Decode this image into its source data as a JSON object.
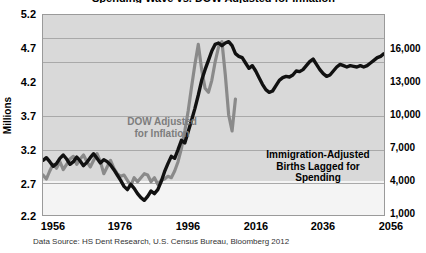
{
  "title": "Spending Wave vs. DOW Adjusted for Inflation",
  "axes": {
    "left_title": "Millions",
    "left_ticks": [
      "5.2",
      "4.7",
      "4.2",
      "3.7",
      "3.2",
      "2.7",
      "2.2"
    ],
    "right_ticks": [
      "16,000",
      "13,000",
      "10,000",
      "7,000",
      "4,000",
      "1,000"
    ],
    "x_ticks": [
      "1956",
      "1976",
      "1996",
      "2016",
      "2036",
      "2056"
    ]
  },
  "annotations": {
    "dow": "DOW Adjusted\nfor Inflation",
    "births": "Immigration-Adjusted\nBirths Lagged for\nSpending"
  },
  "source": "Data Source: HS Dent Research, U.S. Census Bureau, Bloomberg 2012",
  "colors": {
    "births_line": "#111111",
    "dow_line": "#8a8a8a",
    "plot_background": "#d9d9d9",
    "plot_background_lower": "#f4f4f4",
    "gridline": "#a9a9a9",
    "frame": "#9a9a9a"
  },
  "chart_data": {
    "type": "line",
    "title": "Spending Wave vs. DOW Adjusted for Inflation",
    "xlabel": "",
    "ylabel": "Millions",
    "xlim": [
      1956,
      2057
    ],
    "ylim": [
      2.2,
      5.2
    ],
    "y2lim": [
      1000,
      16000
    ],
    "y2label": "",
    "grid": true,
    "legend": "annotations-in-plot",
    "series": [
      {
        "name": "Immigration-Adjusted Births Lagged for Spending",
        "color": "#111111",
        "axis": "left",
        "points": [
          [
            1956,
            3.02
          ],
          [
            1957,
            3.06
          ],
          [
            1958,
            3.0
          ],
          [
            1959,
            2.93
          ],
          [
            1960,
            2.97
          ],
          [
            1961,
            3.05
          ],
          [
            1962,
            3.1
          ],
          [
            1963,
            3.04
          ],
          [
            1964,
            2.96
          ],
          [
            1965,
            3.0
          ],
          [
            1966,
            3.07
          ],
          [
            1967,
            3.01
          ],
          [
            1968,
            2.94
          ],
          [
            1969,
            2.99
          ],
          [
            1970,
            3.06
          ],
          [
            1971,
            3.12
          ],
          [
            1972,
            3.05
          ],
          [
            1973,
            2.98
          ],
          [
            1974,
            3.03
          ],
          [
            1975,
            3.0
          ],
          [
            1976,
            2.95
          ],
          [
            1977,
            2.88
          ],
          [
            1978,
            2.8
          ],
          [
            1979,
            2.72
          ],
          [
            1980,
            2.63
          ],
          [
            1981,
            2.58
          ],
          [
            1982,
            2.66
          ],
          [
            1983,
            2.6
          ],
          [
            1984,
            2.52
          ],
          [
            1985,
            2.46
          ],
          [
            1986,
            2.42
          ],
          [
            1987,
            2.48
          ],
          [
            1988,
            2.56
          ],
          [
            1989,
            2.52
          ],
          [
            1990,
            2.58
          ],
          [
            1991,
            2.7
          ],
          [
            1992,
            2.85
          ],
          [
            1993,
            2.97
          ],
          [
            1994,
            3.08
          ],
          [
            1995,
            3.05
          ],
          [
            1996,
            3.18
          ],
          [
            1997,
            3.32
          ],
          [
            1998,
            3.28
          ],
          [
            1999,
            3.45
          ],
          [
            2000,
            3.62
          ],
          [
            2001,
            3.8
          ],
          [
            2002,
            4.0
          ],
          [
            2003,
            4.22
          ],
          [
            2004,
            4.38
          ],
          [
            2005,
            4.52
          ],
          [
            2006,
            4.66
          ],
          [
            2007,
            4.76
          ],
          [
            2008,
            4.78
          ],
          [
            2009,
            4.74
          ],
          [
            2010,
            4.78
          ],
          [
            2011,
            4.8
          ],
          [
            2012,
            4.74
          ],
          [
            2013,
            4.62
          ],
          [
            2014,
            4.58
          ],
          [
            2015,
            4.56
          ],
          [
            2016,
            4.48
          ],
          [
            2017,
            4.4
          ],
          [
            2018,
            4.44
          ],
          [
            2019,
            4.36
          ],
          [
            2020,
            4.26
          ],
          [
            2021,
            4.16
          ],
          [
            2022,
            4.08
          ],
          [
            2023,
            4.04
          ],
          [
            2024,
            4.06
          ],
          [
            2025,
            4.14
          ],
          [
            2026,
            4.22
          ],
          [
            2027,
            4.26
          ],
          [
            2028,
            4.28
          ],
          [
            2029,
            4.27
          ],
          [
            2030,
            4.3
          ],
          [
            2031,
            4.36
          ],
          [
            2032,
            4.35
          ],
          [
            2033,
            4.38
          ],
          [
            2034,
            4.44
          ],
          [
            2035,
            4.5
          ],
          [
            2036,
            4.54
          ],
          [
            2037,
            4.46
          ],
          [
            2038,
            4.38
          ],
          [
            2039,
            4.32
          ],
          [
            2040,
            4.28
          ],
          [
            2041,
            4.3
          ],
          [
            2042,
            4.36
          ],
          [
            2043,
            4.42
          ],
          [
            2044,
            4.46
          ],
          [
            2045,
            4.44
          ],
          [
            2046,
            4.42
          ],
          [
            2047,
            4.44
          ],
          [
            2048,
            4.43
          ],
          [
            2049,
            4.42
          ],
          [
            2050,
            4.44
          ],
          [
            2051,
            4.42
          ],
          [
            2052,
            4.44
          ],
          [
            2053,
            4.48
          ],
          [
            2054,
            4.52
          ],
          [
            2055,
            4.56
          ],
          [
            2056,
            4.58
          ],
          [
            2057,
            4.62
          ]
        ]
      },
      {
        "name": "DOW Adjusted for Inflation",
        "color": "#8a8a8a",
        "axis": "right",
        "points": [
          [
            1956,
            2.8
          ],
          [
            1957,
            2.74
          ],
          [
            1958,
            2.86
          ],
          [
            1959,
            2.96
          ],
          [
            1960,
            2.9
          ],
          [
            1961,
            3.0
          ],
          [
            1962,
            2.88
          ],
          [
            1963,
            2.96
          ],
          [
            1964,
            3.04
          ],
          [
            1965,
            3.08
          ],
          [
            1966,
            2.96
          ],
          [
            1967,
            3.04
          ],
          [
            1968,
            3.1
          ],
          [
            1969,
            3.0
          ],
          [
            1970,
            2.92
          ],
          [
            1971,
            3.02
          ],
          [
            1972,
            3.12
          ],
          [
            1973,
            3.0
          ],
          [
            1974,
            2.82
          ],
          [
            1975,
            2.92
          ],
          [
            1976,
            3.02
          ],
          [
            1977,
            2.9
          ],
          [
            1978,
            2.82
          ],
          [
            1979,
            2.78
          ],
          [
            1980,
            2.8
          ],
          [
            1981,
            2.72
          ],
          [
            1982,
            2.64
          ],
          [
            1983,
            2.76
          ],
          [
            1984,
            2.7
          ],
          [
            1985,
            2.76
          ],
          [
            1986,
            2.82
          ],
          [
            1987,
            2.8
          ],
          [
            1988,
            2.7
          ],
          [
            1989,
            2.76
          ],
          [
            1990,
            2.66
          ],
          [
            1991,
            2.72
          ],
          [
            1992,
            2.74
          ],
          [
            1993,
            2.78
          ],
          [
            1994,
            2.76
          ],
          [
            1995,
            2.86
          ],
          [
            1996,
            3.0
          ],
          [
            1997,
            3.2
          ],
          [
            1998,
            3.46
          ],
          [
            1999,
            3.76
          ],
          [
            2000,
            4.12
          ],
          [
            2001,
            4.46
          ],
          [
            2002,
            4.76
          ],
          [
            2003,
            4.38
          ],
          [
            2004,
            4.1
          ],
          [
            2005,
            4.04
          ],
          [
            2006,
            4.22
          ],
          [
            2007,
            4.5
          ],
          [
            2008,
            4.72
          ],
          [
            2009,
            4.8
          ],
          [
            2010,
            4.3
          ],
          [
            2011,
            3.7
          ],
          [
            2012,
            3.46
          ],
          [
            2013,
            3.94
          ]
        ]
      }
    ]
  }
}
